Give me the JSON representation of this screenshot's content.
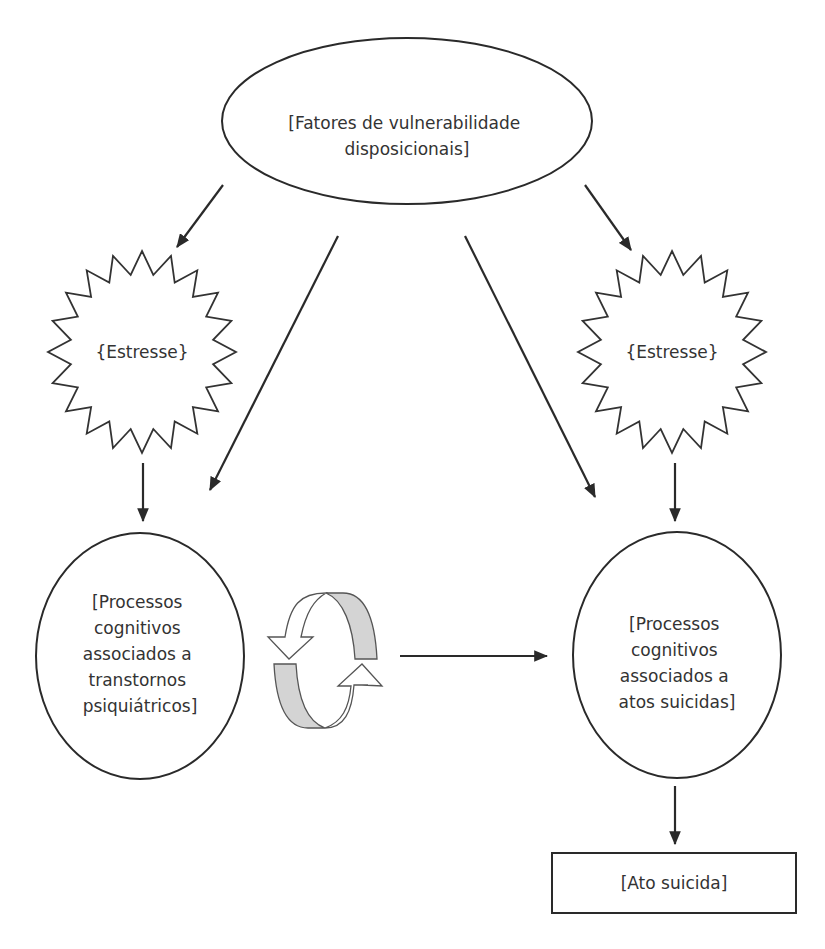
{
  "diagram": {
    "title": "",
    "nodes": {
      "vulnerability": {
        "shape": "ellipse",
        "lines": [
          "[Fatores de vulnerabilidade",
          "disposicionais]"
        ]
      },
      "stress_left": {
        "shape": "starburst",
        "lines": [
          "{Estresse}"
        ]
      },
      "stress_right": {
        "shape": "starburst",
        "lines": [
          "{Estresse}"
        ]
      },
      "cognitive_psychiatric": {
        "shape": "ellipse",
        "lines": [
          "[Processos",
          "cognitivos",
          "associados a",
          "transtornos",
          "psiquiátricos]"
        ]
      },
      "cognitive_suicidal": {
        "shape": "ellipse",
        "lines": [
          "[Processos",
          "cognitivos",
          "associados a",
          "atos suicidas]"
        ]
      },
      "suicide_act": {
        "shape": "rectangle",
        "lines": [
          "[Ato suicida]"
        ]
      }
    },
    "cycle_icon": "circular-arrows-icon",
    "edges": [
      {
        "from": "vulnerability",
        "to": "stress_left"
      },
      {
        "from": "vulnerability",
        "to": "cognitive_psychiatric"
      },
      {
        "from": "vulnerability",
        "to": "cognitive_suicidal"
      },
      {
        "from": "vulnerability",
        "to": "stress_right"
      },
      {
        "from": "stress_left",
        "to": "cognitive_psychiatric"
      },
      {
        "from": "stress_right",
        "to": "cognitive_suicidal"
      },
      {
        "from": "cognitive_psychiatric",
        "to": "cognitive_suicidal"
      },
      {
        "from": "cognitive_suicidal",
        "to": "suicide_act"
      }
    ],
    "colors": {
      "stroke": "#2a2a2a",
      "text": "#333333",
      "cycle_fill": "#d4d4d4",
      "background": "#ffffff"
    }
  }
}
